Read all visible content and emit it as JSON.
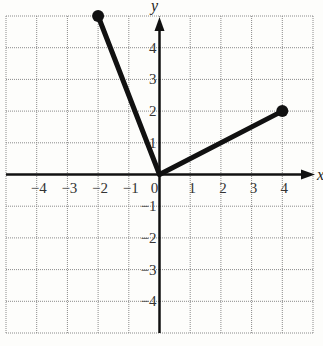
{
  "chart_data": {
    "type": "line",
    "title": "",
    "xlabel": "x",
    "ylabel": "y",
    "xlim": [
      -5,
      5
    ],
    "ylim": [
      -5,
      5
    ],
    "grid": true,
    "x_ticks": [
      "-4",
      "-3",
      "-2",
      "-1",
      "0",
      "1",
      "2",
      "3",
      "4"
    ],
    "y_ticks": [
      "4",
      "3",
      "2",
      "1",
      "-1",
      "-2",
      "-3",
      "-4"
    ],
    "series": [
      {
        "name": "segment-left",
        "points": [
          [
            0,
            0
          ],
          [
            -2,
            5
          ]
        ],
        "endpoint_marker": [
          -2,
          5
        ]
      },
      {
        "name": "segment-right",
        "points": [
          [
            0,
            0
          ],
          [
            4,
            2
          ]
        ],
        "endpoint_marker": [
          4,
          2
        ]
      }
    ],
    "colors": {
      "grid": "#8a8a8a",
      "axes": "#111111",
      "lines": "#111111"
    }
  }
}
